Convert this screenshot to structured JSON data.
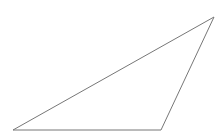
{
  "canvas": {
    "width": 218,
    "height": 140,
    "background": "#ffffff"
  },
  "triangle": {
    "stroke": "#777777",
    "stroke_width": 1,
    "fill": "none",
    "vertices": [
      {
        "x": 13,
        "y": 130
      },
      {
        "x": 161,
        "y": 130
      },
      {
        "x": 214,
        "y": 17
      }
    ]
  }
}
